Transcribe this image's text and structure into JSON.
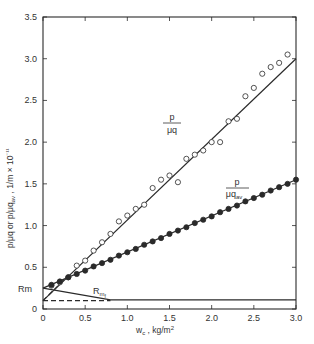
{
  "chart_data": {
    "type": "scatter",
    "title": "",
    "xlabel": "w_c , kg/m²",
    "ylabel": "p/μq or p/μq_av , 1/m × 10⁻¹¹",
    "xlim": [
      0,
      3.0
    ],
    "ylim": [
      0,
      3.5
    ],
    "x_ticks": [
      "0",
      "0.5",
      "1.0",
      "1.5",
      "2.0",
      "2.5",
      "3.0"
    ],
    "y_ticks": [
      "0",
      "0.5",
      "1.0",
      "1.5",
      "2.0",
      "2.5",
      "3.0",
      "3.5"
    ],
    "grid": false,
    "annotations": [
      {
        "text": "Rm",
        "x": -0.12,
        "y": 0.25
      },
      {
        "text": "R_mf",
        "x": 0.6,
        "y": 0.18
      },
      {
        "text": "p / μq",
        "x": 1.2,
        "y": 2.35
      },
      {
        "text": "p / μq_av",
        "x": 2.15,
        "y": 1.67
      }
    ],
    "series": [
      {
        "name": "p/μq",
        "marker": "open-circle",
        "x": [
          0.1,
          0.2,
          0.3,
          0.4,
          0.5,
          0.6,
          0.7,
          0.8,
          0.9,
          1.0,
          1.1,
          1.2,
          1.3,
          1.4,
          1.5,
          1.6,
          1.7,
          1.8,
          1.9,
          2.0,
          2.1,
          2.2,
          2.3,
          2.4,
          2.5,
          2.6,
          2.7,
          2.8,
          2.9
        ],
        "values": [
          0.28,
          0.32,
          0.38,
          0.52,
          0.58,
          0.7,
          0.8,
          0.9,
          1.05,
          1.12,
          1.2,
          1.25,
          1.45,
          1.55,
          1.6,
          1.52,
          1.8,
          1.85,
          1.9,
          2.0,
          2.0,
          2.25,
          2.28,
          2.55,
          2.65,
          2.82,
          2.9,
          2.95,
          3.05
        ],
        "fit_line": {
          "x": [
            0,
            3.0
          ],
          "y": [
            0.1,
            3.0
          ]
        }
      },
      {
        "name": "p/μq_av",
        "marker": "filled-circle",
        "x": [
          0.1,
          0.2,
          0.3,
          0.4,
          0.5,
          0.6,
          0.7,
          0.8,
          0.9,
          1.0,
          1.1,
          1.2,
          1.3,
          1.4,
          1.5,
          1.6,
          1.7,
          1.8,
          1.9,
          2.0,
          2.1,
          2.2,
          2.3,
          2.4,
          2.5,
          2.6,
          2.7,
          2.8,
          2.9,
          3.0
        ],
        "values": [
          0.29,
          0.33,
          0.38,
          0.42,
          0.46,
          0.51,
          0.55,
          0.59,
          0.64,
          0.68,
          0.72,
          0.77,
          0.81,
          0.85,
          0.9,
          0.94,
          0.98,
          1.03,
          1.07,
          1.11,
          1.16,
          1.2,
          1.24,
          1.29,
          1.33,
          1.37,
          1.42,
          1.46,
          1.5,
          1.55
        ],
        "fit_line": {
          "x": [
            0,
            3.0
          ],
          "y": [
            0.25,
            1.55
          ]
        }
      },
      {
        "name": "R_mf",
        "marker": "none",
        "line_style": "solid",
        "x": [
          0,
          0.8,
          3.0
        ],
        "values": [
          0.25,
          0.11,
          0.11
        ]
      },
      {
        "name": "dashed baseline",
        "marker": "none",
        "line_style": "dashed",
        "x": [
          0,
          0.8
        ],
        "values": [
          0.1,
          0.1
        ]
      },
      {
        "name": "dashed extrapolation",
        "marker": "none",
        "line_style": "dashed",
        "x": [
          0,
          0.3
        ],
        "values": [
          0.1,
          0.4
        ]
      }
    ]
  },
  "labels": {
    "rm": "Rm",
    "rmf_main": "R",
    "rmf_sub": "m",
    "rmf_subsub": "f",
    "series1_num": "p",
    "series1_den": "μq",
    "series2_num": "p",
    "series2_den": "μq",
    "series2_den_sub": "av",
    "xlabel_main": "w",
    "xlabel_sub": "c",
    "xlabel_rest": " , kg/m",
    "xlabel_sup": "2",
    "ylabel_a": "p/μq or p/μq",
    "ylabel_sub": "av",
    "ylabel_b": " , 1/m × 10",
    "ylabel_sup": "⁻¹¹"
  }
}
